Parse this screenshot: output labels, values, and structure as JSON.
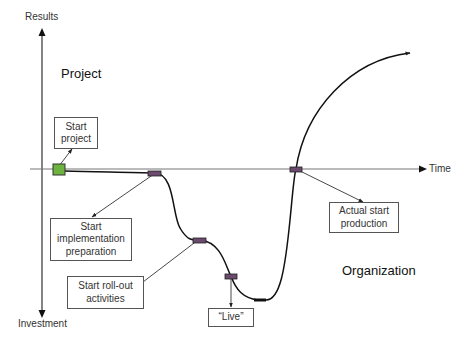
{
  "axes": {
    "y_top_label": "Results",
    "y_bottom_label": "Investment",
    "x_label": "Time"
  },
  "regions": {
    "top": "Project",
    "bottom": "Organization"
  },
  "milestones": [
    {
      "id": "start-project",
      "label_line1": "Start",
      "label_line2": "project",
      "label_line3": ""
    },
    {
      "id": "start-implementation-preparation",
      "label_line1": "Start",
      "label_line2": "implementation",
      "label_line3": "preparation"
    },
    {
      "id": "start-roll-out-activities",
      "label_line1": "Start roll-out",
      "label_line2": "activities",
      "label_line3": ""
    },
    {
      "id": "live",
      "label_line1": "“Live”",
      "label_line2": "",
      "label_line3": ""
    },
    {
      "id": "actual-start-production",
      "label_line1": "Actual start",
      "label_line2": "production",
      "label_line3": ""
    }
  ],
  "colors": {
    "start_marker": "#6db33f",
    "milestone_marker": "#6b4a6e",
    "axis": "#666666",
    "curve": "#111111",
    "box_border": "#555555"
  }
}
